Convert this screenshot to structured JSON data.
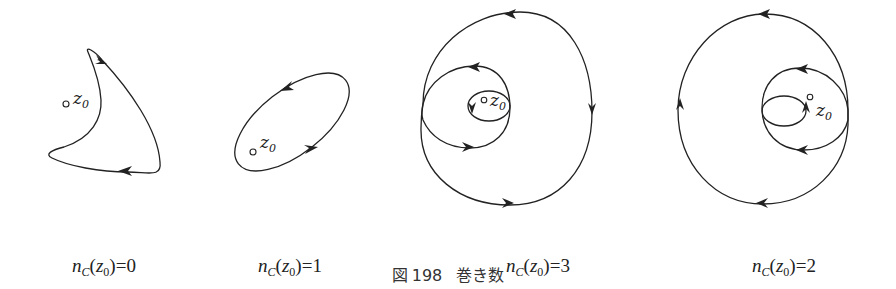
{
  "figure": {
    "caption_label": "図",
    "caption_number": "198",
    "caption_title": "巻き数"
  },
  "point_label": {
    "base": "z",
    "sub": "0"
  },
  "panels": [
    {
      "id": "panel-0",
      "n": "n",
      "sub_C": "C",
      "z": "z",
      "z_sub": "0",
      "eq": "=0",
      "winding_number": 0,
      "center_x": 104
    },
    {
      "id": "panel-1",
      "n": "n",
      "sub_C": "C",
      "z": "z",
      "z_sub": "0",
      "eq": "=1",
      "winding_number": 1,
      "center_x": 290
    },
    {
      "id": "panel-2",
      "n": "n",
      "sub_C": "C",
      "z": "z",
      "z_sub": "0",
      "eq": "=3",
      "winding_number": 3,
      "center_x": 538
    },
    {
      "id": "panel-3",
      "n": "n",
      "sub_C": "C",
      "z": "z",
      "z_sub": "0",
      "eq": "=2",
      "winding_number": 2,
      "center_x": 784
    }
  ],
  "colors": {
    "stroke": "#222222",
    "background": "#ffffff"
  }
}
